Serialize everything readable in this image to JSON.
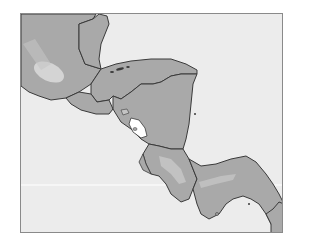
{
  "map": {
    "region": "Central America",
    "colors": {
      "sea": "#ececec",
      "land": "#a9a9a9",
      "highland": "#cfcfcf",
      "border": "#3a3a3a",
      "lake": "#ffffff",
      "frame": "#8a8a8a"
    },
    "countries": [
      "Guatemala",
      "Belize",
      "Honduras",
      "El Salvador",
      "Nicaragua",
      "Costa Rica",
      "Panama"
    ],
    "features": [
      "Bay Islands",
      "Lake Nicaragua",
      "Lake Managua"
    ]
  }
}
